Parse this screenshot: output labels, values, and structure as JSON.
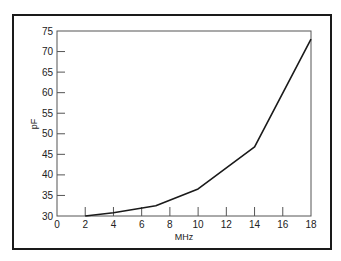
{
  "chart_data": {
    "type": "line",
    "title": "",
    "xlabel": "MHz",
    "ylabel": "pF",
    "xlim": [
      0,
      18
    ],
    "ylim": [
      30,
      75
    ],
    "x_ticks": [
      0,
      2,
      4,
      6,
      8,
      10,
      12,
      14,
      16,
      18
    ],
    "y_ticks": [
      30,
      35,
      40,
      45,
      50,
      55,
      60,
      65,
      70,
      75
    ],
    "grid": false,
    "legend": null,
    "series": [
      {
        "name": "capacitance",
        "x": [
          2,
          4,
          7,
          10,
          14,
          18
        ],
        "y": [
          30,
          30.8,
          32.5,
          36.6,
          46.8,
          73
        ]
      }
    ]
  },
  "plot": {
    "left": 57,
    "right": 311,
    "top": 31,
    "bottom": 216,
    "line_color": "#1a1a1a",
    "axis_color": "#555555"
  }
}
